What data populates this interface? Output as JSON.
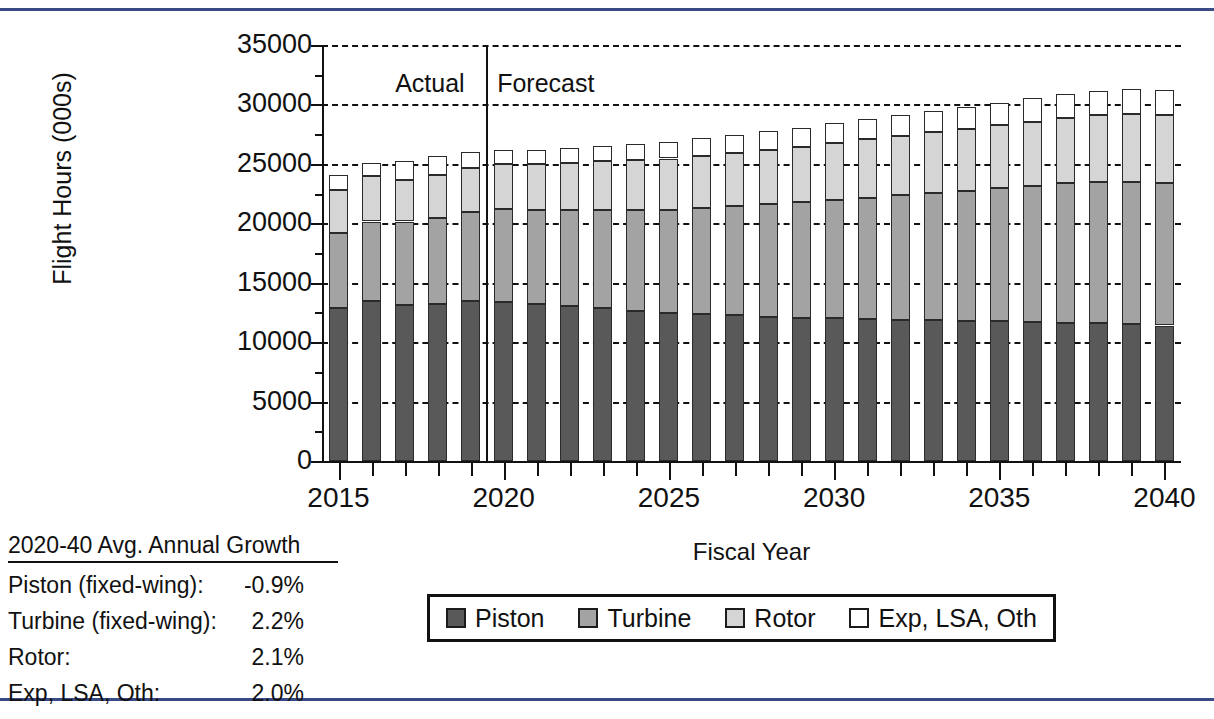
{
  "figure": {
    "yaxis_title": "Flight Hours (000s)",
    "xaxis_title": "Fiscal Year",
    "actual_label": "Actual",
    "forecast_label": "Forecast"
  },
  "legend": {
    "items": [
      {
        "label": "Piston",
        "color": "#595959"
      },
      {
        "label": "Turbine",
        "color": "#a3a3a3"
      },
      {
        "label": "Rotor",
        "color": "#d5d5d5"
      },
      {
        "label": "Exp, LSA, Oth",
        "color": "#ffffff"
      }
    ]
  },
  "growth_table": {
    "title": "2020-40 Avg. Annual Growth",
    "rows": [
      {
        "label": "Piston (fixed-wing):",
        "value": "-0.9%"
      },
      {
        "label": "Turbine (fixed-wing):",
        "value": "2.2%"
      },
      {
        "label": "Rotor:",
        "value": "2.1%"
      },
      {
        "label": "Exp, LSA, Oth:",
        "value": "2.0%"
      }
    ]
  },
  "chart_data": {
    "type": "bar",
    "stacked": true,
    "title": "",
    "xlabel": "Fiscal Year",
    "ylabel": "Flight Hours (000s)",
    "ylim": [
      0,
      35000
    ],
    "ytick_step": 5000,
    "yticks": [
      0,
      5000,
      10000,
      15000,
      20000,
      25000,
      30000,
      35000
    ],
    "ytick_labels": [
      "0",
      "5000",
      "10000",
      "15000",
      "20000",
      "25000",
      "30000",
      "35000"
    ],
    "grid": true,
    "legend_position": "bottom",
    "xticks_labeled": [
      2015,
      2020,
      2025,
      2030,
      2035,
      2040
    ],
    "categories": [
      2015,
      2016,
      2017,
      2018,
      2019,
      2020,
      2021,
      2022,
      2023,
      2024,
      2025,
      2026,
      2027,
      2028,
      2029,
      2030,
      2031,
      2032,
      2033,
      2034,
      2035,
      2036,
      2037,
      2038,
      2039,
      2040
    ],
    "annotations": [
      {
        "text": "Actual",
        "x": 2018.2
      },
      {
        "text": "Forecast",
        "x": 2020.3
      },
      {
        "text": "divider",
        "x": 2019.5
      }
    ],
    "series": [
      {
        "name": "Piston",
        "color": "#595959",
        "values": [
          12900,
          13500,
          13100,
          13200,
          13500,
          13400,
          13200,
          13050,
          12850,
          12650,
          12450,
          12350,
          12250,
          12150,
          12050,
          12000,
          11950,
          11900,
          11850,
          11800,
          11750,
          11700,
          11650,
          11600,
          11550,
          11400
        ]
      },
      {
        "name": "Turbine",
        "color": "#a3a3a3",
        "values": [
          6250,
          6650,
          7050,
          7250,
          7450,
          7800,
          7900,
          8050,
          8250,
          8450,
          8700,
          8950,
          9200,
          9450,
          9700,
          9950,
          10200,
          10450,
          10700,
          10950,
          11200,
          11450,
          11700,
          11900,
          11950,
          11950
        ]
      },
      {
        "name": "Rotor",
        "color": "#d5d5d5",
        "values": [
          3650,
          3850,
          3450,
          3600,
          3700,
          3800,
          3900,
          4000,
          4100,
          4200,
          4300,
          4400,
          4500,
          4600,
          4700,
          4800,
          4900,
          5000,
          5100,
          5200,
          5300,
          5400,
          5500,
          5600,
          5700,
          5750
        ]
      },
      {
        "name": "Exp, LSA, Oth",
        "color": "#ffffff",
        "values": [
          1300,
          1100,
          1600,
          1600,
          1350,
          1150,
          1200,
          1250,
          1300,
          1350,
          1400,
          1450,
          1500,
          1550,
          1600,
          1650,
          1700,
          1750,
          1800,
          1850,
          1900,
          1950,
          2000,
          2050,
          2100,
          2150
        ]
      }
    ]
  }
}
